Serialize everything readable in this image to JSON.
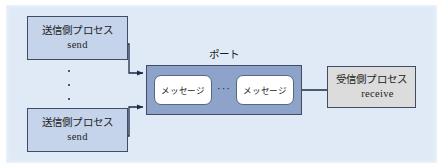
{
  "diagram": {
    "background_color": "#dfeaf6",
    "senders": [
      {
        "jp": "送信側プロセス",
        "en": "send"
      },
      {
        "jp": "送信側プロセス",
        "en": "send"
      }
    ],
    "sender_ellipsis": "⋮",
    "port": {
      "label": "ポート",
      "fill_color": "#8ea3ca",
      "messages": [
        {
          "label": "メッセージ"
        },
        {
          "label": "メッセージ"
        }
      ],
      "message_ellipsis": "···"
    },
    "receiver": {
      "jp": "受信側プロセス",
      "en": "receive",
      "fill_color": "#dcdcdc"
    },
    "arrows": [
      {
        "name": "send-top-to-port",
        "from": "送信側プロセス send",
        "to": "ポート"
      },
      {
        "name": "send-bottom-to-port",
        "from": "送信側プロセス send",
        "to": "ポート"
      },
      {
        "name": "port-to-receive",
        "from": "ポート",
        "to": "受信側プロセス receive"
      }
    ]
  }
}
